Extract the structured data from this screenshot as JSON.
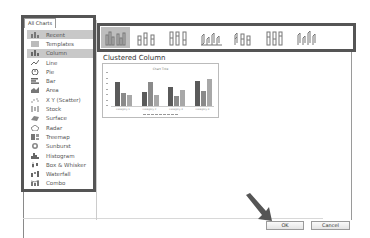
{
  "dialog": {
    "tab_label": "All Charts",
    "categories": [
      {
        "label": "Recent",
        "icon": "recent-icon",
        "selected": true
      },
      {
        "label": "Templates",
        "icon": "templates-icon",
        "selected": false
      },
      {
        "label": "Column",
        "icon": "column-chart-icon",
        "selected": true
      },
      {
        "label": "Line",
        "icon": "line-chart-icon",
        "selected": false
      },
      {
        "label": "Pie",
        "icon": "pie-chart-icon",
        "selected": false
      },
      {
        "label": "Bar",
        "icon": "bar-chart-icon",
        "selected": false
      },
      {
        "label": "Area",
        "icon": "area-chart-icon",
        "selected": false
      },
      {
        "label": "X Y (Scatter)",
        "icon": "scatter-chart-icon",
        "selected": false
      },
      {
        "label": "Stock",
        "icon": "stock-chart-icon",
        "selected": false
      },
      {
        "label": "Surface",
        "icon": "surface-chart-icon",
        "selected": false
      },
      {
        "label": "Radar",
        "icon": "radar-chart-icon",
        "selected": false
      },
      {
        "label": "Treemap",
        "icon": "treemap-chart-icon",
        "selected": false
      },
      {
        "label": "Sunburst",
        "icon": "sunburst-chart-icon",
        "selected": false
      },
      {
        "label": "Histogram",
        "icon": "histogram-chart-icon",
        "selected": false
      },
      {
        "label": "Box & Whisker",
        "icon": "box-whisker-chart-icon",
        "selected": false
      },
      {
        "label": "Waterfall",
        "icon": "waterfall-chart-icon",
        "selected": false
      },
      {
        "label": "Combo",
        "icon": "combo-chart-icon",
        "selected": false
      }
    ],
    "subtypes": [
      {
        "name": "clustered-column",
        "selected": true
      },
      {
        "name": "stacked-column",
        "selected": false
      },
      {
        "name": "100-stacked-column",
        "selected": false
      },
      {
        "name": "3d-clustered-column",
        "selected": false
      },
      {
        "name": "3d-stacked-column",
        "selected": false
      },
      {
        "name": "3d-100-stacked-column",
        "selected": false
      },
      {
        "name": "3d-column",
        "selected": false
      }
    ],
    "subtype_title": "Clustered Column",
    "preview": {
      "title": "Chart Title",
      "categories": [
        "Category 1",
        "Category 2",
        "Category 3",
        "Category 4"
      ],
      "series": [
        {
          "name": "Series 1",
          "color": "#5a5a5a",
          "values": [
            4.3,
            2.5,
            3.5,
            4.5
          ]
        },
        {
          "name": "Series 2",
          "color": "#8a8a8a",
          "values": [
            2.4,
            4.4,
            1.8,
            2.8
          ]
        },
        {
          "name": "Series 3",
          "color": "#a8a8a8",
          "values": [
            2.0,
            2.0,
            3.0,
            5.0
          ]
        }
      ],
      "ymax": 6
    },
    "ok_label": "OK",
    "cancel_label": "Cancel"
  }
}
